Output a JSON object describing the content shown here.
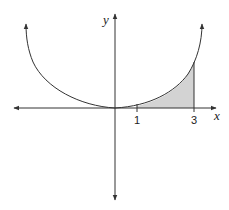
{
  "figure": {
    "axes": {
      "x_label": "x",
      "y_label": "y"
    },
    "ticks": [
      {
        "value": 1,
        "label": "1"
      },
      {
        "value": 3,
        "label": "3"
      }
    ],
    "shaded_region": {
      "from": 1,
      "to": 3,
      "fill": "#d3d3d3"
    },
    "colors": {
      "stroke": "#333333",
      "shade": "#d3d3d3",
      "background": "#ffffff"
    }
  }
}
